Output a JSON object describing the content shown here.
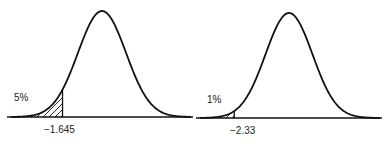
{
  "chart_data": [
    {
      "type": "area",
      "title": "",
      "distribution": "standard normal",
      "shaded_region": "left tail",
      "tail_percent_label": "5%",
      "critical_value_label": "-1.645",
      "critical_value": -1.645,
      "tail_probability": 0.05
    },
    {
      "type": "area",
      "title": "",
      "distribution": "standard normal",
      "shaded_region": "left tail",
      "tail_percent_label": "1%",
      "critical_value_label": "−2.33",
      "critical_value": -2.33,
      "tail_probability": 0.01
    }
  ],
  "panels": [
    {
      "percent": "5%",
      "z": "−1.645"
    },
    {
      "percent": "1%",
      "z": "−2.33"
    }
  ]
}
